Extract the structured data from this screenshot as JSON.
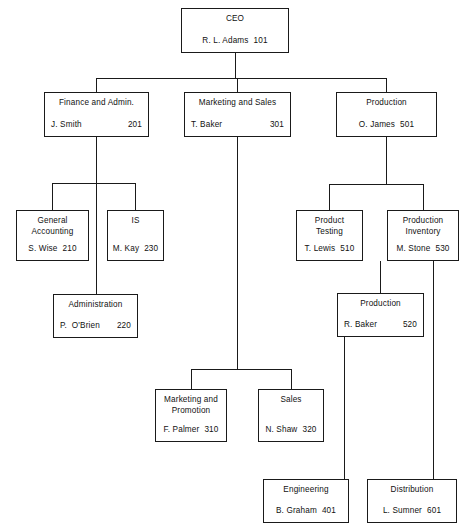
{
  "chart_title": "Organization Chart",
  "nodes": [
    {
      "id": "ceo",
      "title": "CEO",
      "person": "R. L. Adams",
      "number": "101",
      "x": 181,
      "y": 8,
      "w": 108,
      "h": 45,
      "spacing": "narrow"
    },
    {
      "id": "finance",
      "title": "Finance and Admin.",
      "person": "J. Smith",
      "number": "201",
      "x": 44,
      "y": 92,
      "w": 105,
      "h": 45,
      "spacing": "wide"
    },
    {
      "id": "marketing",
      "title": "Marketing and Sales",
      "person": "T. Baker",
      "number": "301",
      "x": 184,
      "y": 92,
      "w": 107,
      "h": 45,
      "spacing": "wide"
    },
    {
      "id": "production",
      "title": "Production",
      "person": "O. James",
      "number": "501",
      "x": 336,
      "y": 92,
      "w": 101,
      "h": 45,
      "spacing": "narrow"
    },
    {
      "id": "general-accounting",
      "title": "General\nAccounting",
      "person": "S. Wise",
      "number": "210",
      "x": 16,
      "y": 210,
      "w": 73,
      "h": 51,
      "spacing": "narrow"
    },
    {
      "id": "is",
      "title": "IS",
      "person": "M. Kay",
      "number": "230",
      "x": 107,
      "y": 210,
      "w": 57,
      "h": 51,
      "spacing": "narrow"
    },
    {
      "id": "administration",
      "title": "Administration",
      "person": "P.  O'Brien",
      "number": "220",
      "x": 53,
      "y": 294,
      "w": 85,
      "h": 44,
      "spacing": "wide"
    },
    {
      "id": "product-testing",
      "title": "Product\nTesting",
      "person": "T. Lewis",
      "number": "510",
      "x": 296,
      "y": 210,
      "w": 67,
      "h": 51,
      "spacing": "narrow"
    },
    {
      "id": "production-inventory",
      "title": "Production\nInventory",
      "person": "M. Stone",
      "number": "530",
      "x": 387,
      "y": 210,
      "w": 72,
      "h": 51,
      "spacing": "narrow"
    },
    {
      "id": "production-520",
      "title": "Production",
      "person": "R. Baker",
      "number": "520",
      "x": 337,
      "y": 293,
      "w": 87,
      "h": 44,
      "spacing": "wide"
    },
    {
      "id": "marketing-promotion",
      "title": "Marketing and\nPromotion",
      "person": "F. Palmer",
      "number": "310",
      "x": 155,
      "y": 389,
      "w": 72,
      "h": 53,
      "spacing": "narrow"
    },
    {
      "id": "sales",
      "title": "Sales",
      "person": "N. Shaw",
      "number": "320",
      "x": 258,
      "y": 389,
      "w": 66,
      "h": 53,
      "spacing": "narrow"
    },
    {
      "id": "engineering",
      "title": "Engineering",
      "person": "B. Graham",
      "number": "401",
      "x": 263,
      "y": 479,
      "w": 86,
      "h": 44,
      "spacing": "narrow"
    },
    {
      "id": "distribution",
      "title": "Distribution",
      "person": "L. Sumner",
      "number": "601",
      "x": 367,
      "y": 479,
      "w": 90,
      "h": 44,
      "spacing": "narrow"
    }
  ],
  "edges": [
    {
      "id": "ceo-to-bus",
      "points": "235,53 235,78"
    },
    {
      "id": "level1-bus",
      "points": "96,78 386,78"
    },
    {
      "id": "bus-to-finance",
      "points": "96,78 96,92"
    },
    {
      "id": "bus-to-marketing",
      "points": "237,78 237,92"
    },
    {
      "id": "bus-to-production",
      "points": "386,78 386,92"
    },
    {
      "id": "finance-down",
      "points": "96,137 96,296"
    },
    {
      "id": "finance-bus",
      "points": "52,183 135,183"
    },
    {
      "id": "bus-to-general-accounting",
      "points": "52,183 52,210"
    },
    {
      "id": "bus-to-is",
      "points": "135,183 135,210"
    },
    {
      "id": "marketing-down",
      "points": "237,137 237,369"
    },
    {
      "id": "marketing-bus",
      "points": "191,369 291,369"
    },
    {
      "id": "bus-to-marketing-promotion",
      "points": "191,369 191,389"
    },
    {
      "id": "bus-to-sales",
      "points": "291,369 291,389"
    },
    {
      "id": "production-down",
      "points": "386,137 386,184"
    },
    {
      "id": "production-bus",
      "points": "329,184 423,184"
    },
    {
      "id": "bus-to-product-testing",
      "points": "329,184 329,210"
    },
    {
      "id": "bus-to-production-inventory",
      "points": "423,184 423,210"
    },
    {
      "id": "inventory-to-production520",
      "points": "380,261 380,293"
    },
    {
      "id": "inventory-to-distribution",
      "points": "433,261 433,479"
    },
    {
      "id": "production520-to-engineering",
      "points": "344,337 344,479"
    }
  ]
}
